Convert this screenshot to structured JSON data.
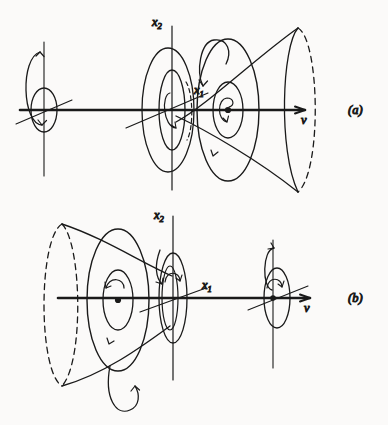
{
  "figure": {
    "kind": "vortex-ring-diagram",
    "background_color": "#fbfaf9",
    "ink_color": "#1a1a1a",
    "width": 388,
    "height": 425,
    "caption_note": "Two-panel line drawing of an axisymmetric vortex ring / cone expanding along the velocity axis"
  },
  "panels": [
    {
      "id": "a",
      "label": "(a)",
      "label_x": 355,
      "label_y": 108,
      "axis_label_v": "v",
      "axis_label_x1": "x₁",
      "axis_label_x2": "x₂",
      "cone_opens": "right",
      "axis_y": 110
    },
    {
      "id": "b",
      "label": "(b)",
      "label_x": 355,
      "label_y": 297,
      "axis_label_v": "v",
      "axis_label_x1": "x₁",
      "axis_label_x2": "x₂",
      "cone_opens": "left",
      "axis_y": 298
    }
  ],
  "labels": {
    "panel_a": "(a)",
    "panel_b": "(b)",
    "v_a": "v",
    "v_b": "v",
    "x1_a": "x",
    "x1_a_sub": "1",
    "x2_a": "x",
    "x2_a_sub": "2",
    "x1_b": "x",
    "x1_b_sub": "1",
    "x2_b": "x",
    "x2_b_sub": "2"
  }
}
